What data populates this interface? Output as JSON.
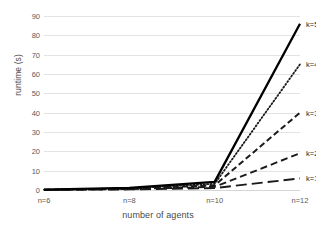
{
  "chart_data": {
    "type": "line",
    "title": "",
    "xlabel": "number of agents",
    "ylabel": "runtime (s)",
    "categories": [
      "n=6",
      "n=8",
      "n=10",
      "n=12"
    ],
    "x": [
      6,
      8,
      10,
      12
    ],
    "ylim": [
      0,
      90
    ],
    "yticks": [
      0,
      10,
      20,
      30,
      40,
      50,
      60,
      70,
      80,
      90
    ],
    "grid": "horizontal",
    "legend_position": "right-inline-labels",
    "series": [
      {
        "name": "k=1",
        "values": [
          0.05,
          0.3,
          1.0,
          6.0
        ],
        "style": "long-dash",
        "width": 1.9,
        "color": "#1a1a1a"
      },
      {
        "name": "k=2",
        "values": [
          0.08,
          0.5,
          1.6,
          19.0
        ],
        "style": "dash",
        "width": 1.9,
        "color": "#1a1a1a"
      },
      {
        "name": "k=3",
        "values": [
          0.1,
          0.7,
          2.4,
          40.0
        ],
        "style": "med-dash",
        "width": 2.0,
        "color": "#1a1a1a"
      },
      {
        "name": "k=4",
        "values": [
          0.12,
          0.9,
          3.2,
          65.0
        ],
        "style": "dot",
        "width": 1.8,
        "color": "#1a1a1a"
      },
      {
        "name": "k=5",
        "values": [
          0.15,
          1.1,
          4.2,
          86.0
        ],
        "style": "solid",
        "width": 2.3,
        "color": "#000000"
      }
    ],
    "colors": {
      "gridline": "#e2e2e2",
      "axis_text": "#595959",
      "label_text": "#4a4a4a",
      "series_ink": "#1a1a1a",
      "background": "#ffffff"
    }
  },
  "ticks": {
    "y": [
      "0",
      "10",
      "20",
      "30",
      "40",
      "50",
      "60",
      "70",
      "80",
      "90"
    ],
    "x": [
      "n=6",
      "n=8",
      "n=10",
      "n=12"
    ]
  },
  "axes": {
    "x_title": "number of agents",
    "y_title": "runtime (s)"
  },
  "series_labels": [
    "k=1",
    "k=2",
    "k=3",
    "k=4",
    "k=5"
  ]
}
